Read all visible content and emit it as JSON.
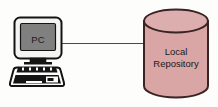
{
  "diagram": {
    "type": "network-topology",
    "background_color": "#fdfdfc",
    "nodes": [
      {
        "id": "pc",
        "kind": "workstation",
        "label": "PC",
        "screen_color": "#808080",
        "bezel_color": "#f2f2f0",
        "outline_color": "#1a1a1a"
      },
      {
        "id": "local-repository",
        "kind": "database-cylinder",
        "label_line1": "Local",
        "label_line2": "Repository",
        "fill_color": "#d9a5a5",
        "top_fill_color": "#dcaeae",
        "outline_color": "#3a2323"
      }
    ],
    "connections": [
      {
        "id": "pc-to-repository",
        "from": "pc",
        "to": "local-repository",
        "style": "solid",
        "color": "#4a4a4a"
      }
    ]
  }
}
